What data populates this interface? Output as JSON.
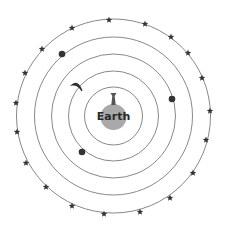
{
  "diagram": {
    "center": {
      "x": 113.5,
      "y": 116
    },
    "earth": {
      "label": "Earth",
      "radius": 13,
      "color": "#a9a9a9"
    },
    "orbits": [
      {
        "name": "orbit-1",
        "radius": 29
      },
      {
        "name": "orbit-2",
        "radius": 45
      },
      {
        "name": "orbit-3",
        "radius": 62
      },
      {
        "name": "orbit-4",
        "radius": 79
      },
      {
        "name": "orbit-5-stars",
        "radius": 97
      }
    ],
    "bodies": [
      {
        "name": "moon",
        "type": "crescent",
        "x": 77,
        "y": 86
      },
      {
        "name": "planet-right",
        "type": "dot",
        "x": 172,
        "y": 99,
        "r": 3.3
      },
      {
        "name": "planet-lower-left",
        "type": "dot",
        "x": 82,
        "y": 152,
        "r": 3.3
      },
      {
        "name": "planet-upper-left",
        "type": "dot",
        "x": 62,
        "y": 54,
        "r": 3.3
      }
    ],
    "stars": [
      {
        "x": 109,
        "y": 20
      },
      {
        "x": 145,
        "y": 24
      },
      {
        "x": 171,
        "y": 37
      },
      {
        "x": 188,
        "y": 53
      },
      {
        "x": 202,
        "y": 78
      },
      {
        "x": 210,
        "y": 111
      },
      {
        "x": 206,
        "y": 140
      },
      {
        "x": 193,
        "y": 173
      },
      {
        "x": 170,
        "y": 198
      },
      {
        "x": 140,
        "y": 212
      },
      {
        "x": 104,
        "y": 214
      },
      {
        "x": 72,
        "y": 206
      },
      {
        "x": 46,
        "y": 187
      },
      {
        "x": 26,
        "y": 163
      },
      {
        "x": 17,
        "y": 132
      },
      {
        "x": 16,
        "y": 103
      },
      {
        "x": 25,
        "y": 73
      },
      {
        "x": 42,
        "y": 49
      },
      {
        "x": 72,
        "y": 28
      }
    ]
  }
}
